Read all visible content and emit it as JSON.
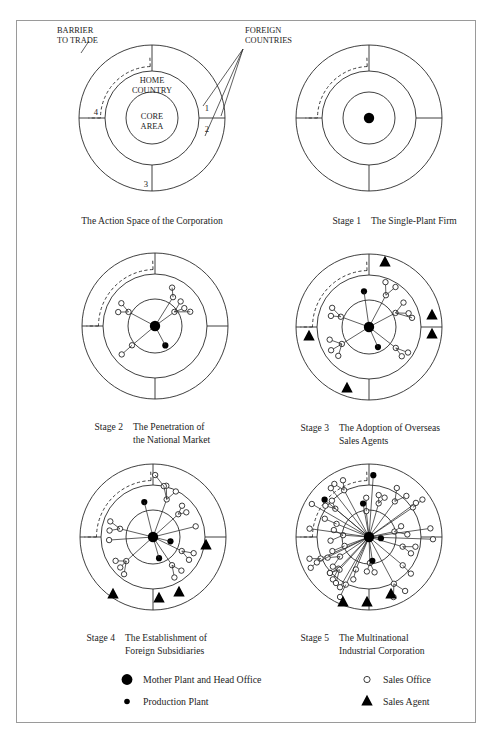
{
  "figure": {
    "title_region_labels": {
      "barrier_to_trade": "BARRIER\nTO TRADE",
      "barrier_line1": "BARRIER",
      "barrier_line2": "TO TRADE",
      "foreign_countries_line1": "FOREIGN",
      "foreign_countries_line2": "COUNTRIES",
      "home_country_line1": "HOME",
      "home_country_line2": "COUNTRY",
      "core_area_line1": "CORE",
      "core_area_line2": "AREA",
      "sector_numbers": [
        "1",
        "2",
        "3",
        "4"
      ]
    },
    "panels": [
      {
        "id": "panel-action-space",
        "caption_stage": "",
        "caption_line1": "The Action Space of the Corporation",
        "caption_line2": ""
      },
      {
        "id": "panel-stage-1",
        "caption_stage": "Stage 1",
        "caption_line1": "The Single-Plant Firm",
        "caption_line2": ""
      },
      {
        "id": "panel-stage-2",
        "caption_stage": "Stage 2",
        "caption_line1": "The Penetration of",
        "caption_line2": "the National Market"
      },
      {
        "id": "panel-stage-3",
        "caption_stage": "Stage 3",
        "caption_line1": "The Adoption of Overseas",
        "caption_line2": "Sales Agents"
      },
      {
        "id": "panel-stage-4",
        "caption_stage": "Stage 4",
        "caption_line1": "The Establishment of",
        "caption_line2": "Foreign Subsidiaries"
      },
      {
        "id": "panel-stage-5",
        "caption_stage": "Stage 5",
        "caption_line1": "The Multinational",
        "caption_line2": "Industrial Corporation"
      }
    ],
    "legend": {
      "items": [
        {
          "symbol": "large-filled-circle-icon",
          "label": "Mother Plant and Head Office"
        },
        {
          "symbol": "small-filled-circle-icon",
          "label": "Production Plant"
        },
        {
          "symbol": "open-circle-icon",
          "label": "Sales Office"
        },
        {
          "symbol": "filled-triangle-icon",
          "label": "Sales Agent"
        }
      ]
    },
    "colors": {
      "ink": "#1d1d1d",
      "stroke": "#2a2a2a",
      "frame": "#9a9a9a",
      "background": "#ffffff"
    }
  },
  "chart_data": {
    "type": "diagram",
    "geometry": {
      "outer_radius": 73,
      "middle_radius": 52,
      "inner_radius": 27,
      "spoke_angles_deg": [
        90,
        0,
        270,
        180
      ]
    },
    "panels": [
      {
        "name": "The Action Space of the Corporation",
        "center": [
          152,
          118
        ],
        "radii": {
          "outer": 73,
          "middle": 47,
          "inner": 26
        },
        "mother_plants": 0,
        "production_plants": 0,
        "sales_offices": 0,
        "sales_agents": 0,
        "annotated": true
      },
      {
        "name": "Stage 1 The Single-Plant Firm",
        "center": [
          369,
          118
        ],
        "radii": {
          "outer": 73,
          "middle": 47,
          "inner": 26
        },
        "mother_plants": 1,
        "production_plants": 0,
        "sales_offices": 0,
        "sales_agents": 0,
        "annotated": false
      },
      {
        "name": "Stage 2 The Penetration of the National Market",
        "center": [
          155,
          326
        ],
        "radii": {
          "outer": 73,
          "middle": 52,
          "inner": 27
        },
        "mother_plants": 1,
        "production_plants": 1,
        "sales_offices": 9,
        "sales_agents": 0,
        "annotated": false
      },
      {
        "name": "Stage 3 The Adoption of Overseas Sales Agents",
        "center": [
          369,
          327
        ],
        "radii": {
          "outer": 73,
          "middle": 52,
          "inner": 27
        },
        "mother_plants": 1,
        "production_plants": 2,
        "sales_offices": 14,
        "sales_agents": 5,
        "annotated": false
      },
      {
        "name": "Stage 4 The Establishment of Foreign Subsidiaries",
        "center": [
          153,
          537
        ],
        "radii": {
          "outer": 73,
          "middle": 52,
          "inner": 27
        },
        "mother_plants": 1,
        "production_plants": 3,
        "sales_offices": 18,
        "sales_agents": 4,
        "annotated": false
      },
      {
        "name": "Stage 5 The Multinational Industrial Corporation",
        "center": [
          369,
          537
        ],
        "radii": {
          "outer": 73,
          "middle": 52,
          "inner": 27
        },
        "mother_plants": 1,
        "production_plants": 5,
        "sales_offices": 29,
        "sales_agents": 3,
        "annotated": false
      }
    ]
  }
}
